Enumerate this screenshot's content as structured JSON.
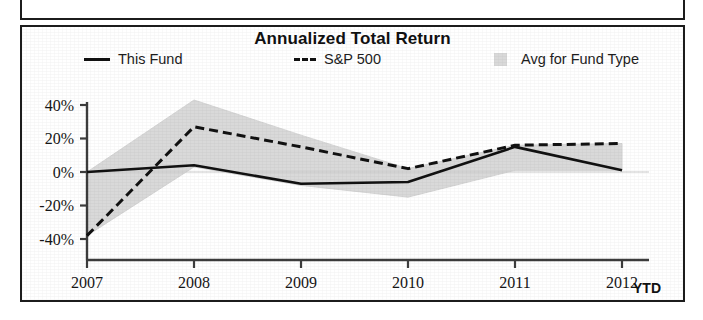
{
  "chart_data": {
    "type": "line",
    "title": "Annualized Total Return",
    "xlabel": "",
    "ylabel": "",
    "x": [
      "2007",
      "2008",
      "2009",
      "2010",
      "2011",
      "2012"
    ],
    "x_axis_note": "YTD",
    "categories": [
      "2007",
      "2008",
      "2009",
      "2010",
      "2011",
      "2012"
    ],
    "ylim": [
      -50,
      48
    ],
    "yticks": [
      -40,
      -20,
      0,
      20,
      40
    ],
    "ytick_labels": [
      "-40%",
      "-20%",
      "0%",
      "20%",
      "40%"
    ],
    "grid": false,
    "legend_position": "top",
    "series": [
      {
        "name": "This Fund",
        "style": "solid",
        "color": "#111111",
        "values": [
          0,
          4,
          -7,
          -6,
          15,
          1
        ]
      },
      {
        "name": "S&P 500",
        "style": "dashed",
        "color": "#111111",
        "values": [
          -38,
          27,
          15,
          2,
          16,
          17
        ]
      },
      {
        "name": "Avg for Fund Type",
        "style": "band",
        "color": "#d9d9d9",
        "upper": [
          0,
          43,
          22,
          2,
          16,
          17
        ],
        "lower": [
          -38,
          3,
          -8,
          -15,
          1,
          1
        ]
      }
    ],
    "annotations": []
  },
  "chart": {
    "title": "Annualized Total Return",
    "ytd_label": "YTD",
    "legend": [
      {
        "label": "This Fund",
        "swatch": "solid-line-swatch"
      },
      {
        "label": "S&P 500",
        "swatch": "dashed-line-swatch"
      },
      {
        "label": "Avg for Fund Type",
        "swatch": "band-fill-swatch"
      }
    ],
    "y_ticks": [
      "40%",
      "20%",
      "0%",
      "-20%",
      "-40%"
    ],
    "x_ticks": [
      "2007",
      "2008",
      "2009",
      "2010",
      "2011",
      "2012"
    ],
    "colors": {
      "line": "#111111",
      "band": "#d9d9d9",
      "axis": "#4a4a4a",
      "border": "#1c1c1c"
    }
  }
}
